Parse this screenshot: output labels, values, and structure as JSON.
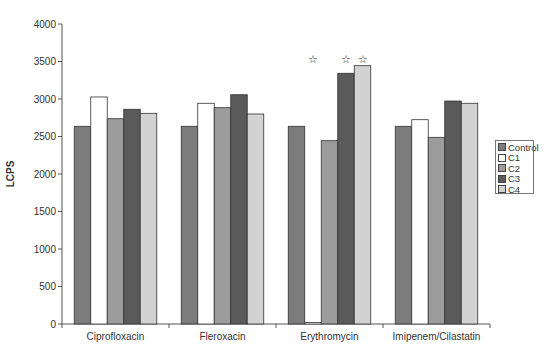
{
  "chart_data": {
    "type": "bar",
    "title": "",
    "xlabel": "",
    "ylabel": "LCPS",
    "ylim": [
      0,
      4000
    ],
    "yticks": [
      0,
      500,
      1000,
      1500,
      2000,
      2500,
      3000,
      3500,
      4000
    ],
    "grid": false,
    "legend_position": "right",
    "categories": [
      "Ciprofloxacin",
      "Fleroxacin",
      "Erythromycin",
      "Imipenem/Cilastatin"
    ],
    "series": [
      {
        "name": "Control",
        "color": "#7c7c7c",
        "values": [
          2636,
          2636,
          2636,
          2636
        ]
      },
      {
        "name": "C1",
        "color": "#ffffff",
        "values": [
          3027,
          2943,
          20,
          2724
        ]
      },
      {
        "name": "C2",
        "color": "#9c9c9c",
        "values": [
          2737,
          2884,
          2444,
          2489
        ]
      },
      {
        "name": "C3",
        "color": "#5a5a5a",
        "values": [
          2863,
          3057,
          3343,
          2973
        ]
      },
      {
        "name": "C4",
        "color": "#d2d2d2",
        "values": [
          2809,
          2800,
          3444,
          2943
        ]
      }
    ],
    "annotations": [
      {
        "text": "☆",
        "category": "Erythromycin",
        "series": "C1",
        "note": "significance marker"
      },
      {
        "text": "☆",
        "category": "Erythromycin",
        "series": "C3",
        "note": "significance marker"
      },
      {
        "text": "☆",
        "category": "Erythromycin",
        "series": "C4",
        "note": "significance marker"
      }
    ]
  },
  "legend": {
    "items": [
      {
        "label": "Control",
        "color": "#7c7c7c"
      },
      {
        "label": "C1",
        "color": "#ffffff"
      },
      {
        "label": "C2",
        "color": "#9c9c9c"
      },
      {
        "label": "C3",
        "color": "#5a5a5a"
      },
      {
        "label": "C4",
        "color": "#d2d2d2"
      }
    ]
  }
}
